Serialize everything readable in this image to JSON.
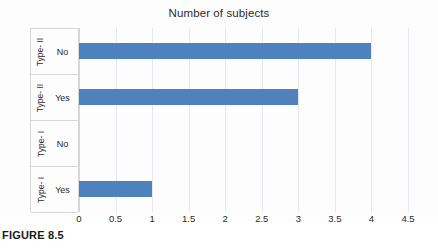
{
  "chart_data": {
    "type": "bar",
    "orientation": "horizontal",
    "title": "Number of subjects",
    "xlabel": "",
    "ylabel": "",
    "categories": [
      "Type- I / Yes",
      "Type- I / No",
      "Type- II / Yes",
      "Type- II / No"
    ],
    "group_labels": [
      "Type- I",
      "Type- I",
      "Type- II",
      "Type- II"
    ],
    "category_labels": [
      "Yes",
      "No",
      "Yes",
      "No"
    ],
    "values": [
      1,
      0,
      3,
      4
    ],
    "xlim": [
      0,
      4.5
    ],
    "xticks": [
      "0",
      "0.5",
      "1",
      "1.5",
      "2",
      "2.5",
      "3",
      "3.5",
      "4",
      "4.5"
    ],
    "xtick_values": [
      0,
      0.5,
      1,
      1.5,
      2,
      2.5,
      3,
      3.5,
      4,
      4.5
    ],
    "grid": true,
    "legend": false,
    "bar_color": "#4f81bd",
    "gridline_color": "#e4e9ef",
    "rows": [
      {
        "group": "Type- II",
        "category": "No",
        "value": 4
      },
      {
        "group": "Type- II",
        "category": "Yes",
        "value": 3
      },
      {
        "group": "Type- I",
        "category": "No",
        "value": 0
      },
      {
        "group": "Type- I",
        "category": "Yes",
        "value": 1
      }
    ]
  },
  "caption": {
    "text": "FIGURE 8.5"
  }
}
